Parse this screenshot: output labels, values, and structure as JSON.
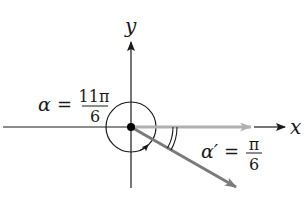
{
  "diagram": {
    "type": "angle-in-standard-position",
    "axes": {
      "x_label": "x",
      "y_label": "y"
    },
    "angle": {
      "symbol": "α",
      "equals": "=",
      "numerator": "11π",
      "denominator": "6"
    },
    "reference_angle": {
      "symbol": "α′",
      "equals": "=",
      "numerator": "π",
      "denominator": "6"
    },
    "colors": {
      "axis": "#1a1a1a",
      "initial_ray": "#b0b0b0",
      "terminal_ray": "#7a7a7a",
      "arc": "#1a1a1a"
    }
  }
}
